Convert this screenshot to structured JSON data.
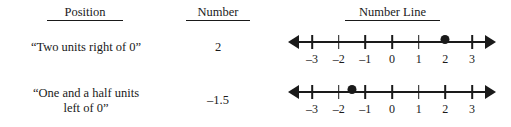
{
  "table": {
    "headers": {
      "position": "Position",
      "number": "Number",
      "number_line": "Number Line"
    },
    "rows": [
      {
        "position": "“Two units right of 0”",
        "number": "2",
        "number_line": {
          "value": 2,
          "tick_labels": [
            "–3",
            "–2",
            "–1",
            "0",
            "1",
            "2",
            "3"
          ],
          "tick_values": [
            -3,
            -2,
            -1,
            0,
            1,
            2,
            3
          ],
          "point_label": "2",
          "tick_hidden_at_point": true,
          "left_arrow": "left-arrowhead",
          "right_arrow": "right-arrowhead"
        }
      },
      {
        "position": "“One and a half units\nleft of 0”",
        "number": "–1.5",
        "number_line": {
          "value": -1.5,
          "tick_labels": [
            "–3",
            "–2",
            "–1",
            "0",
            "1",
            "2",
            "3"
          ],
          "tick_values": [
            -3,
            -2,
            -1,
            0,
            1,
            2,
            3
          ],
          "point_label": "–1.5",
          "tick_hidden_at_point": false,
          "left_arrow": "left-arrowhead",
          "right_arrow": "right-arrowhead"
        }
      }
    ]
  },
  "style": {
    "ink": "#1a1a1a",
    "background": "#ffffff"
  }
}
